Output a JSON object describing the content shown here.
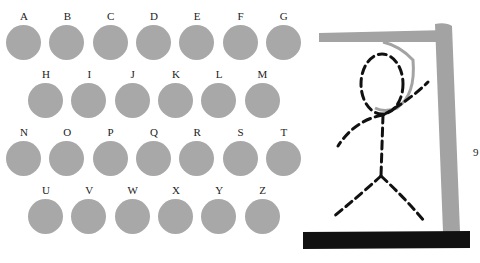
{
  "keyboard": {
    "rows": [
      [
        "A",
        "B",
        "C",
        "D",
        "E",
        "F",
        "G"
      ],
      [
        "H",
        "I",
        "J",
        "K",
        "L",
        "M"
      ],
      [
        "N",
        "O",
        "P",
        "Q",
        "R",
        "S",
        "T"
      ],
      [
        "U",
        "V",
        "W",
        "X",
        "Y",
        "Z"
      ]
    ],
    "button_color": "#a8a8a8"
  },
  "gallows": {
    "post_color": "#a3a3a3",
    "base_color": "#111111",
    "rope_color": "#a3a3a3",
    "figure_color": "#111111"
  },
  "counter": "9"
}
